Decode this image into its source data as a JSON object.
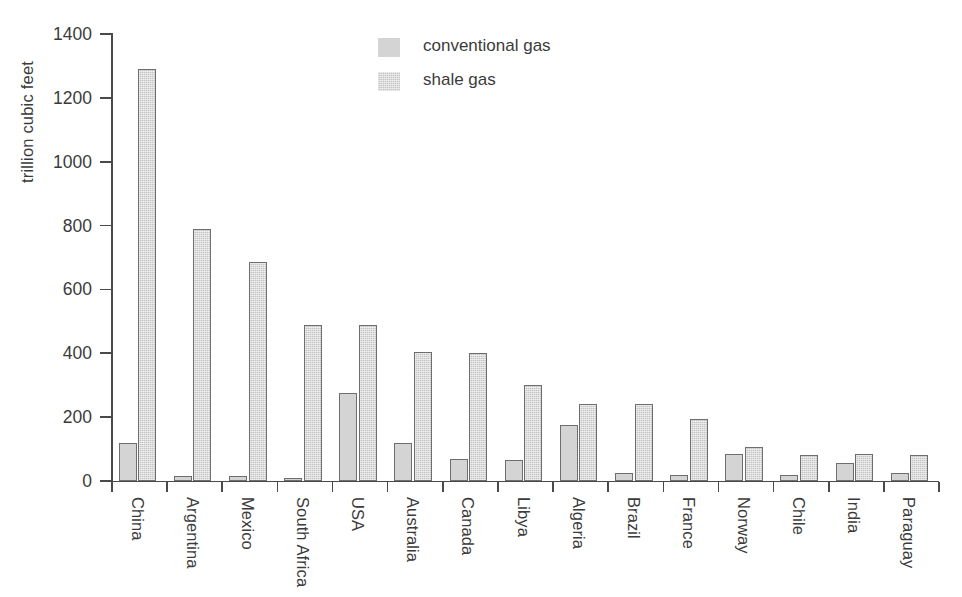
{
  "chart_data": {
    "type": "bar",
    "title": "",
    "xlabel": "",
    "ylabel": "trillion cubic feet",
    "ylim": [
      0,
      1400
    ],
    "yticks": [
      0,
      200,
      400,
      600,
      800,
      1000,
      1200,
      1400
    ],
    "ytick_labels": [
      "0",
      "200",
      "400",
      "600",
      "800",
      "1000",
      "1200",
      "1400"
    ],
    "grid": false,
    "legend_position": "top-center",
    "categories": [
      "China",
      "Argentina",
      "Mexico",
      "South Africa",
      "USA",
      "Australia",
      "Canada",
      "Libya",
      "Algeria",
      "Brazil",
      "France",
      "Norway",
      "Chile",
      "India",
      "Paraguay"
    ],
    "series": [
      {
        "name": "conventional gas",
        "color": "#d4d4d4",
        "values": [
          120,
          15,
          15,
          10,
          275,
          120,
          70,
          65,
          175,
          25,
          20,
          85,
          20,
          55,
          25
        ]
      },
      {
        "name": "shale gas",
        "color": "#c3c3c3",
        "values": [
          1290,
          790,
          685,
          490,
          490,
          405,
          400,
          300,
          240,
          240,
          195,
          105,
          80,
          85,
          80
        ]
      }
    ]
  },
  "legend": {
    "items": [
      {
        "label": "conventional gas",
        "key": "conventional"
      },
      {
        "label": "shale gas",
        "key": "shale"
      }
    ]
  }
}
